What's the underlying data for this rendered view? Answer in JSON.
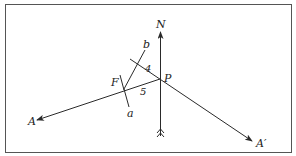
{
  "diagram": {
    "labels": {
      "north": "N",
      "point_p": "P",
      "point_f": "F",
      "point_a_upper": "b",
      "point_a_lower": "a",
      "ray_a": "A",
      "ray_a_prime": "A′",
      "angle_4": "4",
      "angle_5": "5"
    },
    "colors": {
      "line": "#2a2a2a",
      "border": "#555555",
      "background": "#ffffff"
    }
  }
}
